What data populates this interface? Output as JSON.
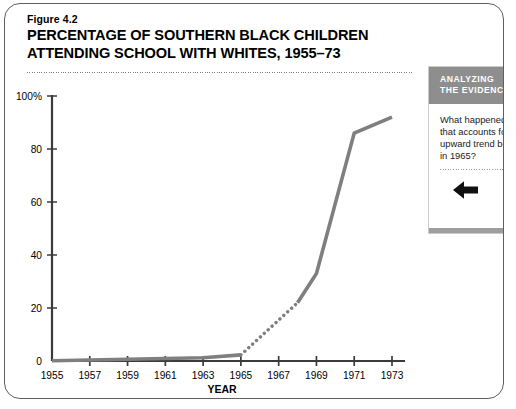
{
  "figure": {
    "number": "Figure 4.2",
    "title": "PERCENTAGE OF SOUTHERN BLACK CHILDREN\nATTENDING SCHOOL WITH WHITES, 1955–73"
  },
  "sidebar": {
    "header": "ANALYZING\nTHE EVIDENCE",
    "question": "What happened in\nthat accounts for \nupward trend beg\nin 1965?",
    "arrow_icon": "left-arrow-icon",
    "header_bg": "#8e8e8e",
    "header_color": "#ffffff"
  },
  "chart_data": {
    "type": "line",
    "title": "PERCENTAGE OF SOUTHERN BLACK CHILDREN ATTENDING SCHOOL WITH WHITES, 1955–73",
    "xlabel": "YEAR",
    "ylabel": "",
    "xlim": [
      1955,
      1973
    ],
    "ylim": [
      0,
      100
    ],
    "grid": false,
    "legend": "none",
    "line_color": "#7f7f7f",
    "axis_color": "#3b3b3b",
    "x_ticks": [
      "1955",
      "1957",
      "1959",
      "1961",
      "1963",
      "1965",
      "1967",
      "1969",
      "1971",
      "1973"
    ],
    "x_tick_values": [
      1955,
      1957,
      1959,
      1961,
      1963,
      1965,
      1967,
      1969,
      1971,
      1973
    ],
    "y_ticks": [
      "0",
      "20",
      "40",
      "60",
      "80",
      "100%"
    ],
    "y_tick_values": [
      0,
      20,
      40,
      60,
      80,
      100
    ],
    "series": [
      {
        "name": "Percentage attending school with whites",
        "style": "solid",
        "x": [
          1955,
          1963,
          1965
        ],
        "values": [
          0.1,
          1.2,
          2.3
        ]
      },
      {
        "name": "Percentage attending school with whites (estimated)",
        "style": "dotted",
        "x": [
          1965,
          1968
        ],
        "values": [
          2.3,
          22
        ]
      },
      {
        "name": "Percentage attending school with whites (continued)",
        "style": "solid",
        "x": [
          1968,
          1969,
          1971,
          1973
        ],
        "values": [
          22,
          33,
          86,
          92
        ]
      }
    ]
  }
}
